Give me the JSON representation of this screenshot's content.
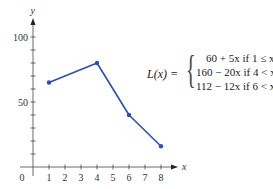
{
  "chart_data": {
    "type": "line",
    "title": "",
    "xlabel": "x",
    "ylabel": "y",
    "x": [
      1,
      4,
      6,
      8
    ],
    "series": [
      {
        "name": "L(x)",
        "values": [
          65,
          80,
          40,
          16
        ],
        "color": "#2b4fb3"
      }
    ],
    "xlim": [
      0,
      8.5
    ],
    "ylim": [
      0,
      110
    ],
    "x_ticks": [
      "1",
      "2",
      "3",
      "4",
      "5",
      "6",
      "7",
      "8"
    ],
    "y_tick_labels": [
      "50",
      "100"
    ],
    "y_minor_tick_step": 10,
    "origin_label": "0",
    "grid": false,
    "legend": "none",
    "annotation": {
      "function_name": "L(x) =",
      "cases": [
        "60 + 5x if 1 ≤ x ≤ 4",
        "160 − 20x if 4 < x ≤ 6",
        "112 − 12x if 6 < x ≤ 8"
      ]
    }
  }
}
